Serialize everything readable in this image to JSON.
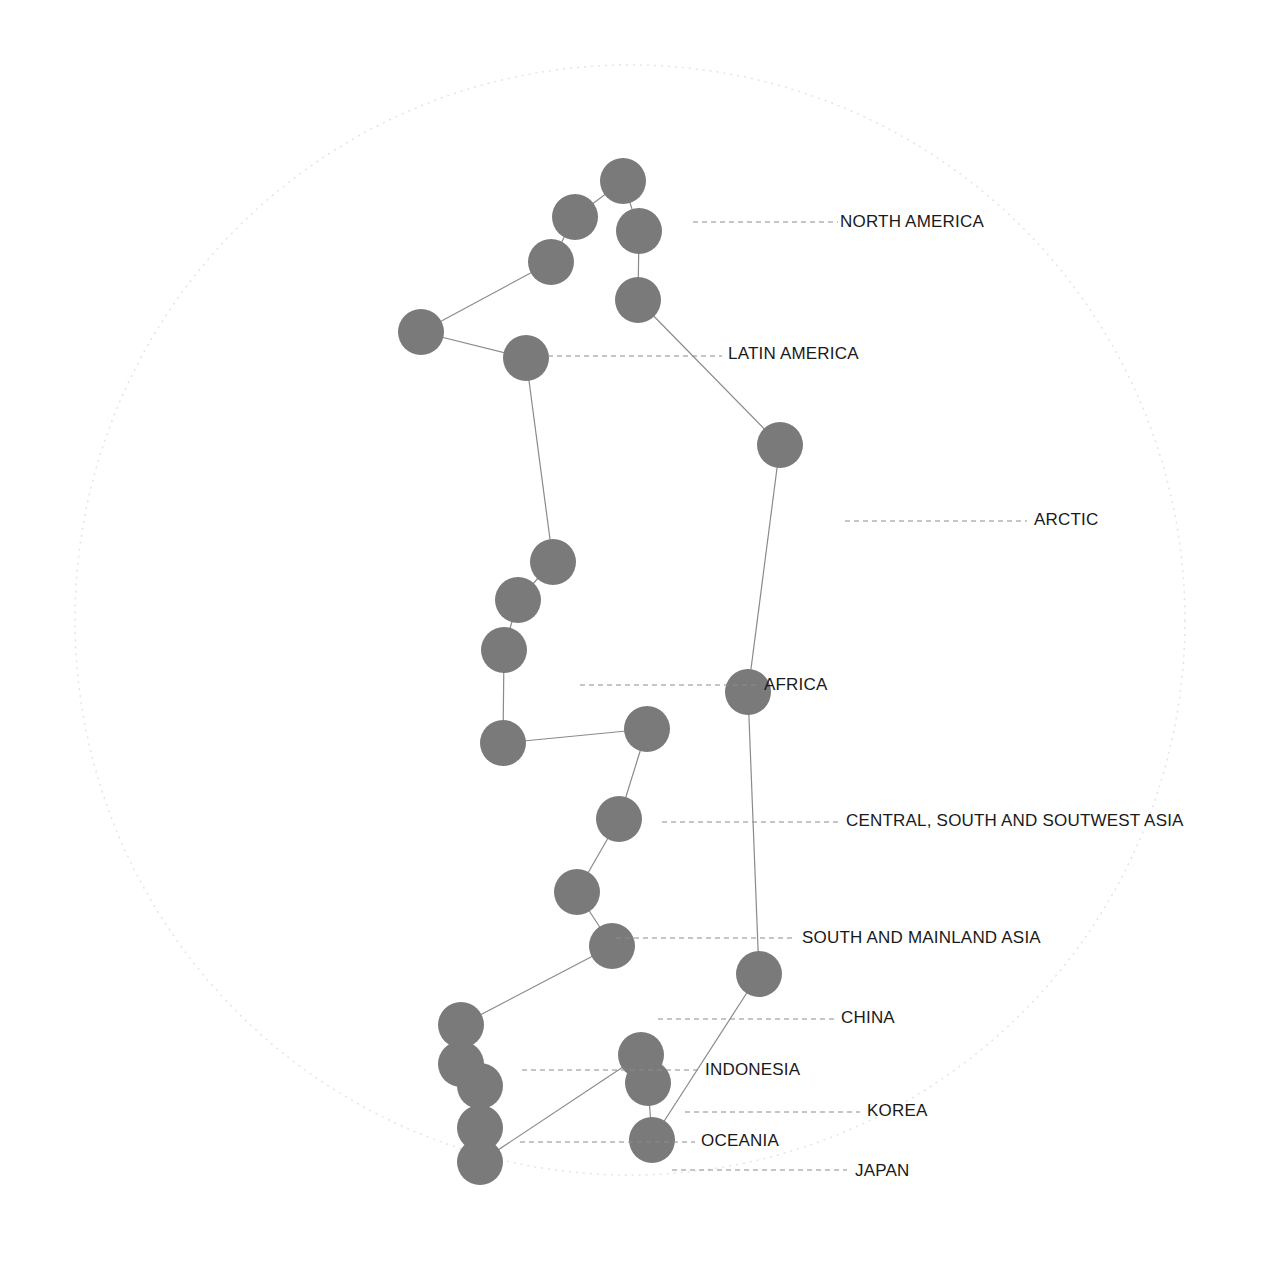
{
  "diagram": {
    "title": "",
    "outer_ring": {
      "cx": 630,
      "cy": 620,
      "r": 555,
      "color": "#e4e4e4"
    },
    "node_color": "#7a7a7a",
    "edge_color": "#8a8a8a",
    "node_radius": 23,
    "nodes": [
      {
        "id": "n1",
        "x": 623,
        "y": 181
      },
      {
        "id": "n2",
        "x": 575,
        "y": 217
      },
      {
        "id": "n3",
        "x": 551,
        "y": 262
      },
      {
        "id": "n4",
        "x": 421,
        "y": 332
      },
      {
        "id": "n5",
        "x": 526,
        "y": 358
      },
      {
        "id": "n6",
        "x": 639,
        "y": 231
      },
      {
        "id": "n7",
        "x": 638,
        "y": 300
      },
      {
        "id": "n8",
        "x": 780,
        "y": 445
      },
      {
        "id": "n9",
        "x": 553,
        "y": 562
      },
      {
        "id": "n10",
        "x": 518,
        "y": 600
      },
      {
        "id": "n11",
        "x": 504,
        "y": 650
      },
      {
        "id": "n12",
        "x": 503,
        "y": 743
      },
      {
        "id": "n13",
        "x": 647,
        "y": 729
      },
      {
        "id": "n14",
        "x": 748,
        "y": 692
      },
      {
        "id": "n15",
        "x": 619,
        "y": 819
      },
      {
        "id": "n16",
        "x": 577,
        "y": 892
      },
      {
        "id": "n17",
        "x": 612,
        "y": 946
      },
      {
        "id": "n18",
        "x": 759,
        "y": 974
      },
      {
        "id": "n19",
        "x": 461,
        "y": 1025
      },
      {
        "id": "n20",
        "x": 461,
        "y": 1064
      },
      {
        "id": "n21",
        "x": 480,
        "y": 1086
      },
      {
        "id": "n22",
        "x": 480,
        "y": 1128
      },
      {
        "id": "n23",
        "x": 480,
        "y": 1162
      },
      {
        "id": "n24",
        "x": 641,
        "y": 1055
      },
      {
        "id": "n25",
        "x": 648,
        "y": 1083
      },
      {
        "id": "n26",
        "x": 652,
        "y": 1140
      }
    ],
    "edges": [
      [
        "n3",
        "n2"
      ],
      [
        "n2",
        "n1"
      ],
      [
        "n1",
        "n6"
      ],
      [
        "n6",
        "n7"
      ],
      [
        "n7",
        "n8"
      ],
      [
        "n8",
        "n14"
      ],
      [
        "n14",
        "n18"
      ],
      [
        "n18",
        "n26"
      ],
      [
        "n26",
        "n25"
      ],
      [
        "n25",
        "n24"
      ],
      [
        "n24",
        "n23"
      ],
      [
        "n23",
        "n22"
      ],
      [
        "n22",
        "n21"
      ],
      [
        "n21",
        "n20"
      ],
      [
        "n20",
        "n19"
      ],
      [
        "n19",
        "n17"
      ],
      [
        "n17",
        "n16"
      ],
      [
        "n16",
        "n15"
      ],
      [
        "n15",
        "n13"
      ],
      [
        "n13",
        "n12"
      ],
      [
        "n12",
        "n11"
      ],
      [
        "n11",
        "n10"
      ],
      [
        "n10",
        "n9"
      ],
      [
        "n9",
        "n5"
      ],
      [
        "n5",
        "n4"
      ],
      [
        "n4",
        "n3"
      ]
    ],
    "labels": [
      {
        "text": "NORTH AMERICA",
        "x": 840,
        "y": 227,
        "leader_x1": 693,
        "leader_x2": 838,
        "leader_y": 222
      },
      {
        "text": "LATIN AMERICA",
        "x": 728,
        "y": 359,
        "leader_x1": 548,
        "leader_x2": 722,
        "leader_y": 356
      },
      {
        "text": "ARCTIC",
        "x": 1034,
        "y": 525,
        "leader_x1": 845,
        "leader_x2": 1027,
        "leader_y": 521
      },
      {
        "text": "AFRICA",
        "x": 764,
        "y": 690,
        "leader_x1": 580,
        "leader_x2": 756,
        "leader_y": 685
      },
      {
        "text": "CENTRAL, SOUTH AND SOUTWEST ASIA",
        "x": 846,
        "y": 826,
        "leader_x1": 662,
        "leader_x2": 838,
        "leader_y": 822
      },
      {
        "text": "SOUTH AND MAINLAND ASIA",
        "x": 802,
        "y": 943,
        "leader_x1": 616,
        "leader_x2": 795,
        "leader_y": 938
      },
      {
        "text": "CHINA",
        "x": 841,
        "y": 1023,
        "leader_x1": 658,
        "leader_x2": 834,
        "leader_y": 1019
      },
      {
        "text": "INDONESIA",
        "x": 705,
        "y": 1075,
        "leader_x1": 522,
        "leader_x2": 698,
        "leader_y": 1070
      },
      {
        "text": "KOREA",
        "x": 867,
        "y": 1116,
        "leader_x1": 685,
        "leader_x2": 860,
        "leader_y": 1112
      },
      {
        "text": "OCEANIA",
        "x": 701,
        "y": 1146,
        "leader_x1": 520,
        "leader_x2": 695,
        "leader_y": 1142
      },
      {
        "text": "JAPAN",
        "x": 855,
        "y": 1176,
        "leader_x1": 672,
        "leader_x2": 847,
        "leader_y": 1170
      }
    ]
  },
  "labels_text": {
    "north_america": "NORTH AMERICA",
    "latin_america": "LATIN AMERICA",
    "arctic": "ARCTIC",
    "africa": "AFRICA",
    "central_south_southwest_asia": "CENTRAL, SOUTH AND SOUTWEST ASIA",
    "south_mainland_asia": "SOUTH AND MAINLAND ASIA",
    "china": "CHINA",
    "indonesia": "INDONESIA",
    "korea": "KOREA",
    "oceania": "OCEANIA",
    "japan": "JAPAN"
  }
}
